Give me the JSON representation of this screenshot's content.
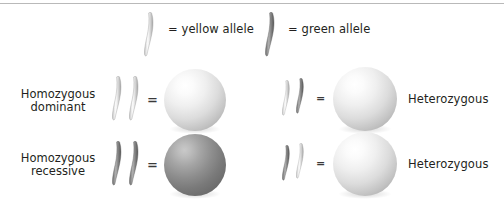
{
  "figure": {
    "type": "genetics-diagram"
  },
  "legend": {
    "items": [
      {
        "id": "yellow-allele",
        "label": "= yellow allele",
        "allele_shade": "light",
        "color": "#d9d9d9"
      },
      {
        "id": "green-allele",
        "label": "= green allele",
        "allele_shade": "dark",
        "color": "#7d7d7d"
      }
    ]
  },
  "equals_symbol": "=",
  "rows": [
    {
      "id": "row-homozygous-dominant",
      "left_label": {
        "line1": "Homozygous",
        "line2": "dominant"
      },
      "left_genotype": {
        "alleles": [
          "light",
          "light"
        ],
        "result_sphere": "light"
      },
      "right_genotype": {
        "alleles": [
          "light",
          "dark"
        ],
        "result_sphere": "light"
      },
      "right_label": "Heterozygous"
    },
    {
      "id": "row-homozygous-recessive",
      "left_label": {
        "line1": "Homozygous",
        "line2": "recessive"
      },
      "left_genotype": {
        "alleles": [
          "dark",
          "dark"
        ],
        "result_sphere": "dark"
      },
      "right_genotype": {
        "alleles": [
          "dark",
          "light"
        ],
        "result_sphere": "light"
      },
      "right_label": "Heterozygous"
    }
  ],
  "colors": {
    "text": "#231f20",
    "rule": "#b9b9b9",
    "sphere_light": "#e6e6e6",
    "sphere_dark": "#8d8d8d",
    "allele_light": "#d9d9d9",
    "allele_dark": "#7d7d7d",
    "background": "#ffffff"
  }
}
